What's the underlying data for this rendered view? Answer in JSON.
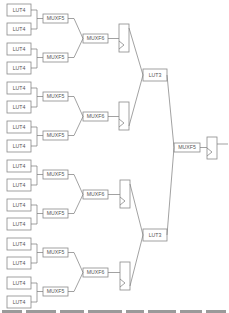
{
  "diagram": {
    "type": "logic-tree",
    "colors": {
      "stroke": "#8a8a8a",
      "wire": "#7a7a7a",
      "text": "#555555",
      "background": "#ffffff"
    },
    "lut4": [
      {
        "label": "LUT4",
        "x": 7,
        "y": 4
      },
      {
        "label": "LUT4",
        "x": 7,
        "y": 23
      },
      {
        "label": "LUT4",
        "x": 7,
        "y": 43
      },
      {
        "label": "LUT4",
        "x": 7,
        "y": 62
      },
      {
        "label": "LUT4",
        "x": 7,
        "y": 82
      },
      {
        "label": "LUT4",
        "x": 7,
        "y": 101
      },
      {
        "label": "LUT4",
        "x": 7,
        "y": 121
      },
      {
        "label": "LUT4",
        "x": 7,
        "y": 140
      },
      {
        "label": "LUT4",
        "x": 7,
        "y": 160
      },
      {
        "label": "LUT4",
        "x": 7,
        "y": 179
      },
      {
        "label": "LUT4",
        "x": 7,
        "y": 199
      },
      {
        "label": "LUT4",
        "x": 7,
        "y": 218
      },
      {
        "label": "LUT4",
        "x": 7,
        "y": 238
      },
      {
        "label": "LUT4",
        "x": 7,
        "y": 257
      },
      {
        "label": "LUT4",
        "x": 7,
        "y": 277
      },
      {
        "label": "LUT4",
        "x": 7,
        "y": 296
      }
    ],
    "muxf5": [
      {
        "label": "MUXF5",
        "x": 43,
        "y": 14
      },
      {
        "label": "MUXF5",
        "x": 43,
        "y": 53
      },
      {
        "label": "MUXF5",
        "x": 43,
        "y": 92
      },
      {
        "label": "MUXF5",
        "x": 43,
        "y": 131
      },
      {
        "label": "MUXF5",
        "x": 43,
        "y": 170
      },
      {
        "label": "MUXF5",
        "x": 43,
        "y": 209
      },
      {
        "label": "MUXF5",
        "x": 43,
        "y": 248
      },
      {
        "label": "MUXF5",
        "x": 43,
        "y": 287
      }
    ],
    "muxf6": [
      {
        "label": "MUXF6",
        "x": 83,
        "y": 34
      },
      {
        "label": "MUXF6",
        "x": 83,
        "y": 112
      },
      {
        "label": "MUXF6",
        "x": 83,
        "y": 190
      },
      {
        "label": "MUXF6",
        "x": 83,
        "y": 268
      }
    ],
    "flipflops": [
      {
        "x": 119,
        "y": 24
      },
      {
        "x": 119,
        "y": 102
      },
      {
        "x": 120,
        "y": 180
      },
      {
        "x": 120,
        "y": 262
      }
    ],
    "lut3": [
      {
        "label": "LUT3",
        "x": 143,
        "y": 69
      },
      {
        "label": "LUT3",
        "x": 143,
        "y": 229
      }
    ],
    "muxf7": {
      "label": "MUXF5",
      "x": 174,
      "y": 143
    },
    "final_ff": {
      "x": 207,
      "y": 137
    }
  },
  "caption": {
    "visible_text": ""
  }
}
